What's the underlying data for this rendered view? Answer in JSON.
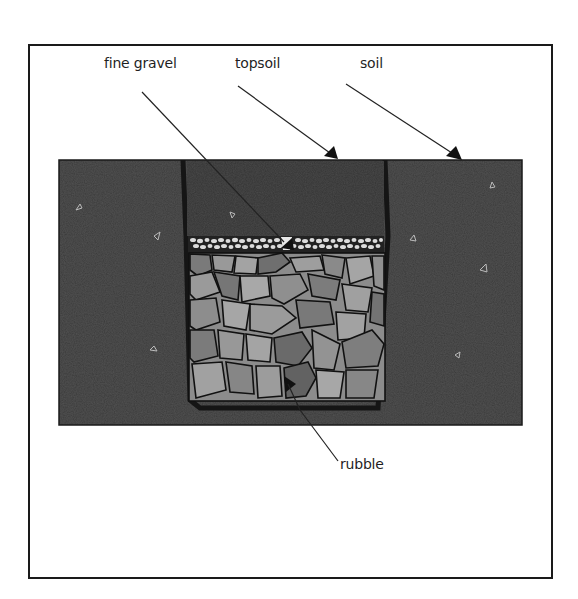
{
  "diagram": {
    "type": "cross-section",
    "labels": {
      "fine_gravel": "fine gravel",
      "topsoil": "topsoil",
      "soil": "soil",
      "rubble": "rubble"
    },
    "layers": [
      {
        "name": "topsoil",
        "color": "#4a4a4a"
      },
      {
        "name": "fine gravel",
        "color": "#d8d8d8"
      },
      {
        "name": "rubble",
        "color": "#8a8a8a"
      },
      {
        "name": "soil",
        "color": "#4f4f4f"
      }
    ],
    "colors": {
      "soil": "#4f4f4f",
      "topsoil": "#474747",
      "gravel_bg": "#1e1e1e",
      "gravel_stone": "#dcdcdc",
      "rubble_light": "#9a9a9a",
      "rubble_dark": "#6e6e6e",
      "outline": "#111111",
      "frame": "#1a1a1a"
    }
  }
}
